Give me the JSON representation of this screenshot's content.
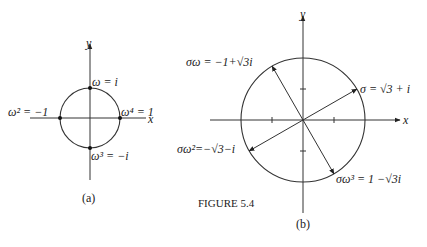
{
  "figure": {
    "caption": "FIGURE 5.4",
    "panel_a": {
      "label": "(a)",
      "x_axis": "x",
      "y_axis": "y",
      "points": [
        {
          "name": "omega",
          "text": "ω = i"
        },
        {
          "name": "omega2",
          "text": "ω² = −1"
        },
        {
          "name": "omega3",
          "text": "ω³ = −i"
        },
        {
          "name": "omega4",
          "text": "ω⁴ = 1"
        }
      ]
    },
    "panel_b": {
      "label": "(b)",
      "x_axis": "x",
      "y_axis": "y",
      "points": [
        {
          "name": "sigma",
          "text": "σ = √3 + i"
        },
        {
          "name": "sigma-omega",
          "text": "σω = −1+√3i"
        },
        {
          "name": "sigma-omega2",
          "text": "σω²=−√3−i"
        },
        {
          "name": "sigma-omega3",
          "text": "σω³ = 1 −√3i"
        }
      ]
    }
  }
}
